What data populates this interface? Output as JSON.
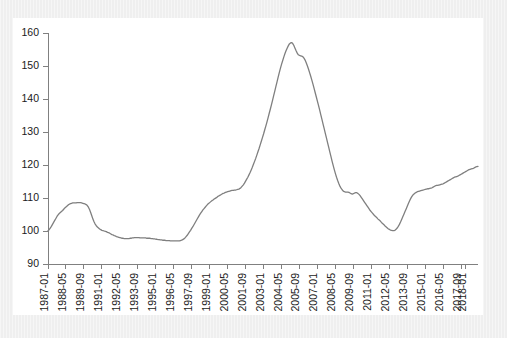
{
  "figure": {
    "background_color": "#efefef",
    "panel_color": "#ffffff",
    "axis_color": "#808080",
    "line_color": "#7f7f7f"
  },
  "chart_data": {
    "type": "line",
    "title": "",
    "subtitle": "",
    "xlabel": "",
    "ylabel": "",
    "grid": false,
    "legend": false,
    "ylim": [
      90,
      160
    ],
    "yticks": [
      90,
      100,
      110,
      120,
      130,
      140,
      150,
      160
    ],
    "ytick_labels": [
      "90",
      "100",
      "110",
      "120",
      "130",
      "140",
      "150",
      "160"
    ],
    "xtick_labels": [
      "1987-01",
      "1988-05",
      "1989-09",
      "1991-01",
      "1992-05",
      "1993-09",
      "1995-01",
      "1996-05",
      "1997-09",
      "1999-01",
      "2000-05",
      "2001-09",
      "2003-01",
      "2004-05",
      "2005-09",
      "2007-01",
      "2008-05",
      "2009-09",
      "2011-01",
      "2012-05",
      "2013-09",
      "2015-01",
      "2016-05",
      "2017-09",
      "2018-01"
    ],
    "xtick_indices": [
      0,
      16,
      32,
      48,
      64,
      80,
      96,
      112,
      128,
      144,
      160,
      176,
      192,
      208,
      224,
      240,
      256,
      272,
      288,
      304,
      320,
      336,
      352,
      368,
      372
    ],
    "x_start": "1987-01",
    "x_end": "2018-01",
    "x_frequency": "monthly",
    "n_points": 373,
    "series": [
      {
        "name": "index",
        "values": [
          100.1,
          100.4,
          100.9,
          101.4,
          102.0,
          102.6,
          103.2,
          103.8,
          104.4,
          104.9,
          105.3,
          105.6,
          105.9,
          106.2,
          106.6,
          107.0,
          107.3,
          107.6,
          107.9,
          108.1,
          108.3,
          108.4,
          108.5,
          108.5,
          108.5,
          108.5,
          108.6,
          108.6,
          108.6,
          108.6,
          108.5,
          108.4,
          108.3,
          108.2,
          108.0,
          107.7,
          107.2,
          106.5,
          105.6,
          104.6,
          103.6,
          102.8,
          102.1,
          101.6,
          101.2,
          100.9,
          100.6,
          100.4,
          100.2,
          100.1,
          100.0,
          99.9,
          99.8,
          99.6,
          99.5,
          99.3,
          99.1,
          98.9,
          98.8,
          98.6,
          98.5,
          98.3,
          98.2,
          98.1,
          98.0,
          97.9,
          97.8,
          97.8,
          97.7,
          97.7,
          97.7,
          97.7,
          97.7,
          97.8,
          97.8,
          97.9,
          97.9,
          98.0,
          98.0,
          98.0,
          98.0,
          98.0,
          97.9,
          97.9,
          97.9,
          97.9,
          97.9,
          97.9,
          97.8,
          97.8,
          97.8,
          97.8,
          97.7,
          97.7,
          97.6,
          97.6,
          97.5,
          97.5,
          97.4,
          97.4,
          97.3,
          97.3,
          97.2,
          97.2,
          97.2,
          97.1,
          97.1,
          97.1,
          97.1,
          97.0,
          97.0,
          97.0,
          97.0,
          97.0,
          97.0,
          97.0,
          97.0,
          97.0,
          97.1,
          97.2,
          97.4,
          97.6,
          97.9,
          98.3,
          98.7,
          99.2,
          99.7,
          100.2,
          100.8,
          101.3,
          101.9,
          102.5,
          103.1,
          103.7,
          104.3,
          104.9,
          105.4,
          105.9,
          106.4,
          106.8,
          107.2,
          107.6,
          108.0,
          108.3,
          108.6,
          108.9,
          109.2,
          109.4,
          109.7,
          109.9,
          110.1,
          110.4,
          110.6,
          110.8,
          111.0,
          111.2,
          111.4,
          111.5,
          111.7,
          111.8,
          111.9,
          112.0,
          112.1,
          112.2,
          112.3,
          112.3,
          112.4,
          112.4,
          112.5,
          112.6,
          112.7,
          112.9,
          113.2,
          113.6,
          114.0,
          114.5,
          115.1,
          115.7,
          116.3,
          117.0,
          117.7,
          118.5,
          119.3,
          120.2,
          121.1,
          122.0,
          123.0,
          124.0,
          125.0,
          126.1,
          127.2,
          128.3,
          129.4,
          130.6,
          131.8,
          133.0,
          134.3,
          135.6,
          136.9,
          138.2,
          139.6,
          141.0,
          142.4,
          143.8,
          145.2,
          146.6,
          148.0,
          149.3,
          150.5,
          151.6,
          152.7,
          153.7,
          154.6,
          155.4,
          156.1,
          156.7,
          157.0,
          157.1,
          156.8,
          156.2,
          155.4,
          154.6,
          153.9,
          153.4,
          153.2,
          153.1,
          153.0,
          152.8,
          152.4,
          151.8,
          151.0,
          150.1,
          149.1,
          148.0,
          146.9,
          145.7,
          144.5,
          143.2,
          141.9,
          140.6,
          139.3,
          138.0,
          136.6,
          135.2,
          133.8,
          132.4,
          131.0,
          129.6,
          128.2,
          126.8,
          125.4,
          124.0,
          122.6,
          121.2,
          119.9,
          118.6,
          117.4,
          116.3,
          115.3,
          114.4,
          113.6,
          113.0,
          112.5,
          112.1,
          111.9,
          111.8,
          111.8,
          111.8,
          111.7,
          111.5,
          111.3,
          111.2,
          111.3,
          111.5,
          111.6,
          111.6,
          111.4,
          111.1,
          110.7,
          110.2,
          109.7,
          109.2,
          108.7,
          108.2,
          107.7,
          107.2,
          106.7,
          106.2,
          105.8,
          105.4,
          105.0,
          104.6,
          104.3,
          104.0,
          103.6,
          103.3,
          103.0,
          102.6,
          102.3,
          102.0,
          101.6,
          101.3,
          101.0,
          100.7,
          100.5,
          100.3,
          100.2,
          100.1,
          100.1,
          100.2,
          100.5,
          100.9,
          101.4,
          102.0,
          102.7,
          103.5,
          104.3,
          105.1,
          105.9,
          106.7,
          107.5,
          108.3,
          109.1,
          109.8,
          110.4,
          110.9,
          111.2,
          111.5,
          111.7,
          111.9,
          112.0,
          112.1,
          112.2,
          112.3,
          112.4,
          112.5,
          112.6,
          112.7,
          112.8,
          112.8,
          112.9,
          113.0,
          113.1,
          113.3,
          113.5,
          113.7,
          113.8,
          113.8,
          113.9,
          114.0,
          114.1,
          114.2,
          114.3,
          114.5,
          114.7,
          114.9,
          115.1,
          115.3,
          115.5,
          115.7,
          115.9,
          116.1,
          116.3,
          116.4,
          116.5,
          116.6,
          116.8,
          117.0,
          117.2,
          117.4,
          117.6,
          117.8,
          118.0,
          118.2,
          118.4,
          118.6,
          118.7,
          118.8,
          118.9,
          119.0,
          119.2,
          119.4,
          119.5,
          119.6
        ]
      }
    ]
  }
}
